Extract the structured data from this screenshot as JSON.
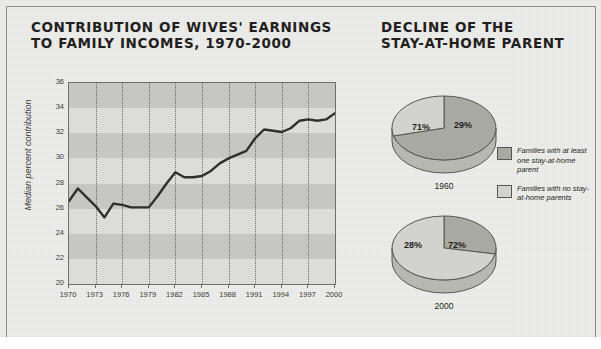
{
  "colors": {
    "paper": "#eeeeec",
    "plot_bg": "#dcdcda",
    "band": "#c6c6c3",
    "line": "#2f2f2d",
    "dark_slice": "#a9a9a4",
    "light_slice": "#d2d2ce",
    "frame": "#8d8d8a",
    "text": "#231f20"
  },
  "left": {
    "title_line1": "CONTRIBUTION OF WIVES' EARNINGS",
    "title_line2": "TO FAMILY INCOMES, 1970-2000",
    "axis_title": "Median percent contribution"
  },
  "right": {
    "title_line1": "DECLINE OF THE",
    "title_line2": "STAY-AT-HOME PARENT",
    "legend": [
      {
        "swatch": "dark",
        "text": "Families with at least one stay-at-home parent"
      },
      {
        "swatch": "light",
        "text": "Families with no stay-at-home parents"
      }
    ]
  },
  "chart_data": [
    {
      "type": "line",
      "title": "CONTRIBUTION OF WIVES' EARNINGS TO FAMILY INCOMES, 1970-2000",
      "xlabel": "",
      "ylabel": "Median percent contribution",
      "ylim": [
        20,
        36
      ],
      "yticks": [
        20,
        22,
        24,
        26,
        28,
        30,
        32,
        34,
        36
      ],
      "xlim": [
        1970,
        2000
      ],
      "xticks": [
        1970,
        1973,
        1976,
        1979,
        1982,
        1985,
        1988,
        1991,
        1994,
        1997,
        2000
      ],
      "grid": "horizontal-bands-and-vertical-dotted",
      "legend": "none",
      "x": [
        1970,
        1971,
        1972,
        1973,
        1974,
        1975,
        1976,
        1977,
        1978,
        1979,
        1980,
        1981,
        1982,
        1983,
        1984,
        1985,
        1986,
        1987,
        1988,
        1989,
        1990,
        1991,
        1992,
        1993,
        1994,
        1995,
        1996,
        1997,
        1998,
        1999,
        2000
      ],
      "values": [
        26.6,
        27.6,
        26.9,
        26.2,
        25.3,
        26.4,
        26.3,
        26.1,
        26.1,
        26.1,
        27.0,
        28.0,
        28.9,
        28.5,
        28.5,
        28.6,
        29.0,
        29.6,
        30.0,
        30.3,
        30.6,
        31.6,
        32.3,
        32.2,
        32.1,
        32.4,
        33.0,
        33.1,
        33.0,
        33.1,
        33.6
      ]
    },
    {
      "type": "pie",
      "title": "1960",
      "labels": [
        "Families with at least one stay-at-home parent",
        "Families with no stay-at-home parents"
      ],
      "values": [
        71,
        29
      ],
      "value_labels": [
        "71%",
        "29%"
      ],
      "colors": [
        "#a9a9a4",
        "#d2d2ce"
      ]
    },
    {
      "type": "pie",
      "title": "2000",
      "labels": [
        "Families with at least one stay-at-home parent",
        "Families with no stay-at-home parents"
      ],
      "values": [
        28,
        72
      ],
      "value_labels": [
        "28%",
        "72%"
      ],
      "colors": [
        "#a9a9a4",
        "#d2d2ce"
      ]
    }
  ]
}
